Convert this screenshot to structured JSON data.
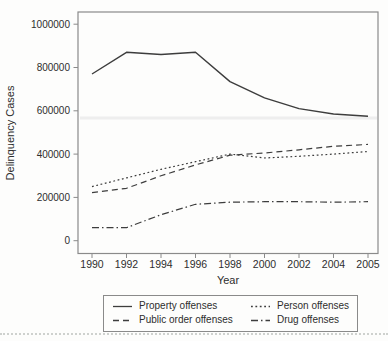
{
  "chart_data": {
    "type": "line",
    "title": "",
    "xlabel": "Year",
    "ylabel": "Delinquency Cases",
    "categories": [
      "1990",
      "1992",
      "1994",
      "1996",
      "1998",
      "2000",
      "2002",
      "2004",
      "2005"
    ],
    "series": [
      {
        "name": "Property offenses",
        "style": "solid",
        "values": [
          770000,
          870000,
          860000,
          870000,
          735000,
          660000,
          610000,
          585000,
          575000
        ]
      },
      {
        "name": "Person offenses",
        "style": "dotted",
        "values": [
          250000,
          290000,
          330000,
          365000,
          400000,
          382000,
          390000,
          400000,
          412000
        ]
      },
      {
        "name": "Public order offenses",
        "style": "dashed",
        "values": [
          222000,
          242000,
          300000,
          350000,
          395000,
          405000,
          420000,
          436000,
          445000
        ]
      },
      {
        "name": "Drug offenses",
        "style": "dashdot",
        "values": [
          60000,
          60000,
          120000,
          168000,
          178000,
          180000,
          180000,
          178000,
          180000
        ]
      }
    ],
    "ylim": [
      0,
      1000000
    ],
    "yticks": [
      0,
      200000,
      400000,
      600000,
      800000,
      1000000
    ],
    "grid": false,
    "legend_position": "bottom-box-two-columns"
  },
  "colors": {
    "line": "#3d3d3d",
    "axis": "#8a8a8a",
    "text": "#2e2e2e",
    "separator": "#ced1ce",
    "scan_artifact": "#eeeeee"
  }
}
